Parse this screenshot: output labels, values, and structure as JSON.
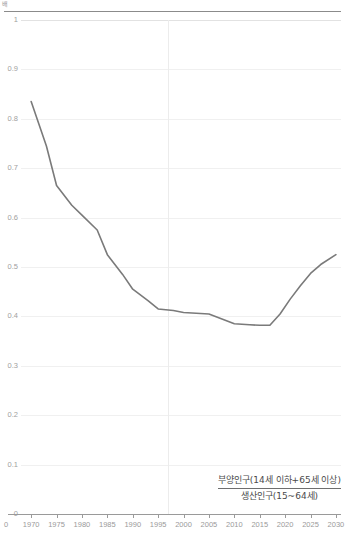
{
  "unit_caption": "배",
  "legend": {
    "numerator": "부양인구(14세 이하+65세 이상)",
    "denominator": "생산인구(15~64세)"
  },
  "chart_data": {
    "type": "line",
    "title": "",
    "subtitle": "",
    "xlabel": "",
    "ylabel": "배",
    "xlim": [
      1968,
      2031
    ],
    "ylim": [
      0,
      1
    ],
    "grid": true,
    "legend_position": "bottom-right",
    "line_color": "#7a7a7a",
    "grid_color": "#f0f0f0",
    "axis_color": "#9a9a9a",
    "label_color": "#a0a0a0",
    "y_ticks": [
      "1",
      "0.9",
      "0.8",
      "0.7",
      "0.6",
      "0.5",
      "0.4",
      "0.3",
      "0.2",
      "0.1",
      "0"
    ],
    "y_tick_values": [
      1,
      0.9,
      0.8,
      0.7,
      0.6,
      0.5,
      0.4,
      0.3,
      0.2,
      0.1,
      0
    ],
    "x_ticks": [
      "1970",
      "1975",
      "1980",
      "1985",
      "1990",
      "1995",
      "2000",
      "2005",
      "2010",
      "2015",
      "2020",
      "2025",
      "2030"
    ],
    "x_tick_values": [
      1970,
      1975,
      1980,
      1985,
      1990,
      1995,
      2000,
      2005,
      2010,
      2015,
      2020,
      2025,
      2030
    ],
    "origin_label": "0",
    "vertical_reference_year": 1997,
    "series": [
      {
        "name": "부양인구(14세 이하+65세 이상)/생산인구(15~64세)",
        "x": [
          1970,
          1973,
          1975,
          1978,
          1980,
          1983,
          1985,
          1988,
          1990,
          1993,
          1995,
          1998,
          2000,
          2005,
          2010,
          2013,
          2015,
          2017,
          2019,
          2021,
          2023,
          2025,
          2027,
          2030
        ],
        "values": [
          0.835,
          0.745,
          0.665,
          0.625,
          0.605,
          0.575,
          0.525,
          0.485,
          0.455,
          0.432,
          0.415,
          0.412,
          0.408,
          0.405,
          0.385,
          0.383,
          0.382,
          0.382,
          0.405,
          0.435,
          0.462,
          0.487,
          0.505,
          0.525
        ]
      }
    ]
  }
}
